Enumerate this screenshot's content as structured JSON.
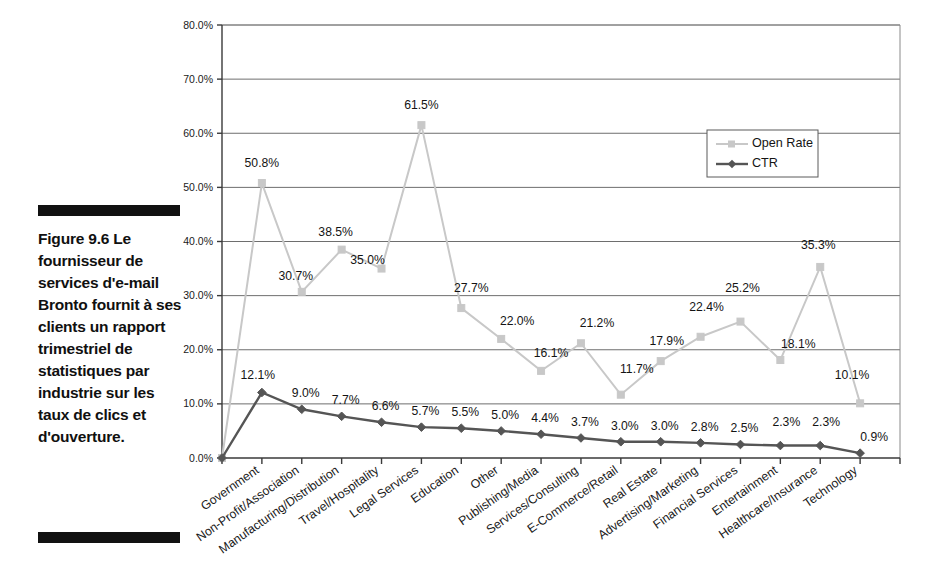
{
  "caption": {
    "rule_top": "divider",
    "rule_bottom": "divider",
    "text": "Figure 9.6 Le fournisseur de services d'e-mail Bronto fournit à ses clients un rapport trimestriel de statistiques par industrie sur les taux de clics et d'ouverture."
  },
  "legend": {
    "position": "inside-top-right",
    "entries": [
      {
        "label": "Open Rate",
        "color": "#c8c8c8",
        "marker": "square"
      },
      {
        "label": "CTR",
        "color": "#555555",
        "marker": "diamond"
      }
    ]
  },
  "colors": {
    "open_rate": "#c8c8c8",
    "ctr": "#555555",
    "grid": "#6e6e6e",
    "axis": "#3a3a3a",
    "text": "#141414",
    "caption_rule": "#111111"
  },
  "chart_data": {
    "type": "line",
    "title": "",
    "subtitle": "",
    "xlabel": "",
    "ylabel": "",
    "ylim": [
      0,
      80
    ],
    "ytick_step": 10,
    "ytick_labels": [
      "0.0%",
      "10.0%",
      "20.0%",
      "30.0%",
      "40.0%",
      "50.0%",
      "60.0%",
      "70.0%",
      "80.0%"
    ],
    "ytick_values": [
      0,
      10,
      20,
      30,
      40,
      50,
      60,
      70,
      80
    ],
    "grid": true,
    "legend": [
      "Open Rate",
      "CTR"
    ],
    "origin_point": 0.0,
    "categories": [
      "Government",
      "Non-Profit/Association",
      "Manufacturing/Distribution",
      "Travel/Hospitality",
      "Legal Services",
      "Education",
      "Other",
      "Publishing/Media",
      "Services/Consulting",
      "E-Commerce/Retail",
      "Real Estate",
      "Advertising/Marketing",
      "Financial Services",
      "Entertainment",
      "Healthcare/Insurance",
      "Technology"
    ],
    "series": [
      {
        "name": "Open Rate",
        "color": "#c8c8c8",
        "marker": "square",
        "values": [
          50.8,
          30.7,
          38.5,
          35.0,
          61.5,
          27.7,
          22.0,
          16.1,
          21.2,
          11.7,
          17.9,
          22.4,
          25.2,
          18.1,
          35.3,
          10.1
        ],
        "labels": [
          "50.8%",
          "30.7%",
          "38.5%",
          "35.0%",
          "61.5%",
          "27.7%",
          "22.0%",
          "16.1%",
          "21.2%",
          "11.7%",
          "17.9%",
          "22.4%",
          "25.2%",
          "18.1%",
          "35.3%",
          "10.1%"
        ]
      },
      {
        "name": "CTR",
        "color": "#555555",
        "marker": "diamond",
        "values": [
          12.1,
          9.0,
          7.7,
          6.6,
          5.7,
          5.5,
          5.0,
          4.4,
          3.7,
          3.0,
          3.0,
          2.8,
          2.5,
          2.3,
          2.3,
          0.9
        ],
        "labels": [
          "12.1%",
          "9.0%",
          "7.7%",
          "6.6%",
          "5.7%",
          "5.5%",
          "5.0%",
          "4.4%",
          "3.7%",
          "3.0%",
          "3.0%",
          "2.8%",
          "2.5%",
          "2.3%",
          "2.3%",
          "0.9%"
        ]
      }
    ]
  }
}
